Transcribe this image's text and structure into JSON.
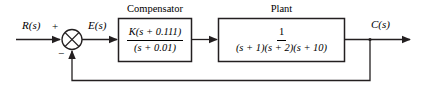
{
  "diagram": {
    "type": "control-system-block-diagram",
    "signals": {
      "input": "R(s)",
      "error": "E(s)",
      "output": "C(s)"
    },
    "summing_junction": {
      "name": "summing-junction",
      "input_sign": "+",
      "feedback_sign": "−"
    },
    "blocks": [
      {
        "id": "compensator",
        "title": "Compensator",
        "numerator": "K(s + 0.111)",
        "denominator": "(s + 0.01)"
      },
      {
        "id": "plant",
        "title": "Plant",
        "numerator": "1",
        "denominator": "(s + 1)(s + 2)(s + 10)"
      }
    ],
    "feedback": {
      "label": "unity-feedback-path",
      "gain": "1"
    },
    "colors": {
      "line": "#231f20",
      "text": "#000000",
      "background": "#ffffff"
    }
  }
}
